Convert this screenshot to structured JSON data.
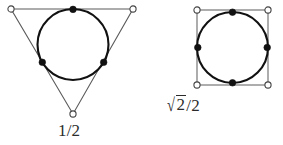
{
  "page": {
    "width": 283,
    "height": 145,
    "background_color": "#ffffff"
  },
  "figures": [
    {
      "id": "triangle-figure",
      "name": "circle-inscribed-in-triangle",
      "label": "1/2",
      "label_parts": {
        "numerator": "1",
        "slash": "/",
        "denominator": "2"
      },
      "shape": {
        "type": "triangle",
        "vertices": [
          {
            "x": 11,
            "y": 9
          },
          {
            "x": 133,
            "y": 9
          },
          {
            "x": 73,
            "y": 114
          }
        ],
        "stroke_color": "#4a4a4a",
        "stroke_width": 1.1,
        "fill": "none"
      },
      "circle": {
        "cx": 73,
        "cy": 44.5,
        "r": 35.5,
        "stroke_color": "#111111",
        "stroke_width": 2.1,
        "fill": "none"
      },
      "open_points": [
        {
          "x": 11,
          "y": 9,
          "r": 3.2
        },
        {
          "x": 133,
          "y": 9,
          "r": 3.2
        },
        {
          "x": 73,
          "y": 114,
          "r": 3.2
        }
      ],
      "filled_points": [
        {
          "x": 73,
          "y": 9,
          "r": 3.2
        },
        {
          "x": 42.2,
          "y": 62.3,
          "r": 3.2
        },
        {
          "x": 103.8,
          "y": 62.3,
          "r": 3.2
        }
      ]
    },
    {
      "id": "square-figure",
      "name": "circle-inscribed-in-square",
      "label": "√2/2",
      "label_parts": {
        "radicand": "2",
        "slash": "/",
        "denominator": "2"
      },
      "shape": {
        "type": "square",
        "vertices": [
          {
            "x": 197,
            "y": 10
          },
          {
            "x": 268,
            "y": 10
          },
          {
            "x": 268,
            "y": 85
          },
          {
            "x": 197,
            "y": 85
          }
        ],
        "stroke_color": "#6a6a6a",
        "stroke_width": 1.1,
        "fill": "none"
      },
      "circle": {
        "cx": 232.5,
        "cy": 47.5,
        "r": 35.5,
        "stroke_color": "#111111",
        "stroke_width": 2.1,
        "fill": "none"
      },
      "open_points": [
        {
          "x": 197,
          "y": 10,
          "r": 3.2
        },
        {
          "x": 268,
          "y": 10,
          "r": 3.2
        },
        {
          "x": 268,
          "y": 85,
          "r": 3.2
        },
        {
          "x": 197,
          "y": 85,
          "r": 3.2
        }
      ],
      "filled_points": [
        {
          "x": 232.5,
          "y": 12,
          "r": 3.2
        },
        {
          "x": 268,
          "y": 47.5,
          "r": 3.2
        },
        {
          "x": 232.5,
          "y": 83,
          "r": 3.2
        },
        {
          "x": 197,
          "y": 47.5,
          "r": 3.2
        }
      ]
    }
  ],
  "colors": {
    "text": "#2b2b2b",
    "circle_stroke": "#111111",
    "polygon_stroke": "#5a5a5a",
    "point_fill": "#111111",
    "open_point_fill": "#ffffff"
  }
}
